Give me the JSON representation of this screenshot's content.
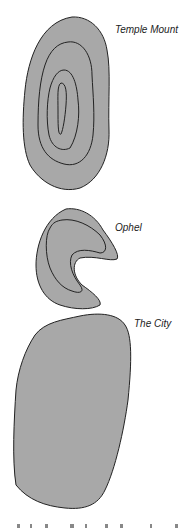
{
  "map": {
    "fill_color": "#a8a8a8",
    "stroke_color": "#222222",
    "regions": [
      {
        "name": "Temple Mount",
        "label": "Temple Mount"
      },
      {
        "name": "Ophel",
        "label": "Ophel"
      },
      {
        "name": "The City",
        "label": "The City"
      }
    ]
  }
}
